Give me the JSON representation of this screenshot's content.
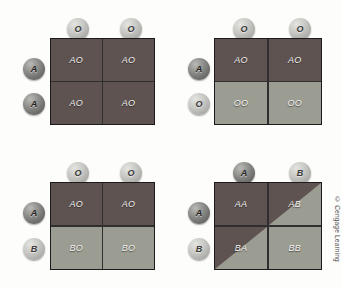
{
  "figure": {
    "copyright": "© Cengage Learning",
    "colors": {
      "cell_red": "#5e5351",
      "cell_green": "#9b9c92",
      "border": "#1b1b1b",
      "background": "#fdfdfc",
      "label_text": "#f2f2f0"
    }
  },
  "squares": [
    {
      "id": "square-1",
      "top_alleles": [
        {
          "label": "O",
          "shade": "light"
        },
        {
          "label": "O",
          "shade": "light"
        }
      ],
      "left_alleles": [
        {
          "label": "A",
          "shade": "dark"
        },
        {
          "label": "A",
          "shade": "dark"
        }
      ],
      "cells": [
        {
          "label": "AO",
          "fill": "red"
        },
        {
          "label": "AO",
          "fill": "red"
        },
        {
          "label": "AO",
          "fill": "red"
        },
        {
          "label": "AO",
          "fill": "red"
        }
      ]
    },
    {
      "id": "square-2",
      "top_alleles": [
        {
          "label": "O",
          "shade": "light"
        },
        {
          "label": "O",
          "shade": "light"
        }
      ],
      "left_alleles": [
        {
          "label": "A",
          "shade": "dark"
        },
        {
          "label": "O",
          "shade": "light"
        }
      ],
      "cells": [
        {
          "label": "AO",
          "fill": "red"
        },
        {
          "label": "AO",
          "fill": "red"
        },
        {
          "label": "OO",
          "fill": "green"
        },
        {
          "label": "OO",
          "fill": "green"
        }
      ]
    },
    {
      "id": "square-3",
      "top_alleles": [
        {
          "label": "O",
          "shade": "light"
        },
        {
          "label": "O",
          "shade": "light"
        }
      ],
      "left_alleles": [
        {
          "label": "A",
          "shade": "dark"
        },
        {
          "label": "B",
          "shade": "light"
        }
      ],
      "cells": [
        {
          "label": "AO",
          "fill": "red"
        },
        {
          "label": "AO",
          "fill": "red"
        },
        {
          "label": "BO",
          "fill": "green"
        },
        {
          "label": "BO",
          "fill": "green"
        }
      ]
    },
    {
      "id": "square-4",
      "top_alleles": [
        {
          "label": "A",
          "shade": "dark"
        },
        {
          "label": "B",
          "shade": "light"
        }
      ],
      "left_alleles": [
        {
          "label": "A",
          "shade": "dark"
        },
        {
          "label": "B",
          "shade": "light"
        }
      ],
      "cells": [
        {
          "label": "AA",
          "fill": "red"
        },
        {
          "label": "AB",
          "fill": "split"
        },
        {
          "label": "BA",
          "fill": "split"
        },
        {
          "label": "BB",
          "fill": "green"
        }
      ]
    }
  ]
}
